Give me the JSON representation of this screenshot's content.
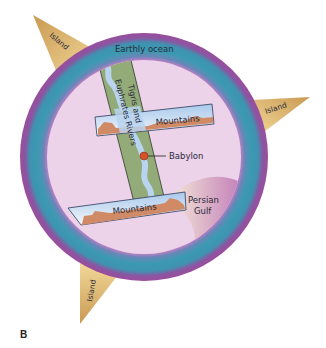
{
  "figure": {
    "letter": "B",
    "ocean_label": "Earthly ocean",
    "islands": [
      {
        "label": "Island",
        "position": "top-left"
      },
      {
        "label": "Island",
        "position": "right"
      },
      {
        "label": "Island",
        "position": "bottom-left"
      }
    ],
    "rivers_label_line1": "Tigris and",
    "rivers_label_line2": "Euphrates Rivers",
    "mountains_top_label": "Mountains",
    "mountains_bottom_label": "Mountains",
    "city_label": "Babylon",
    "gulf_label_line1": "Persian",
    "gulf_label_line2": "Gulf"
  },
  "colors": {
    "ocean_outer": "#9b4f9e",
    "ocean_inner": "#3d98b0",
    "land": "#ecd3ea",
    "island": "#e4b562",
    "river_band": "#93ab78",
    "water": "#b9d4ee",
    "mountain": "#d08a66",
    "city_dot": "#d5532a"
  }
}
